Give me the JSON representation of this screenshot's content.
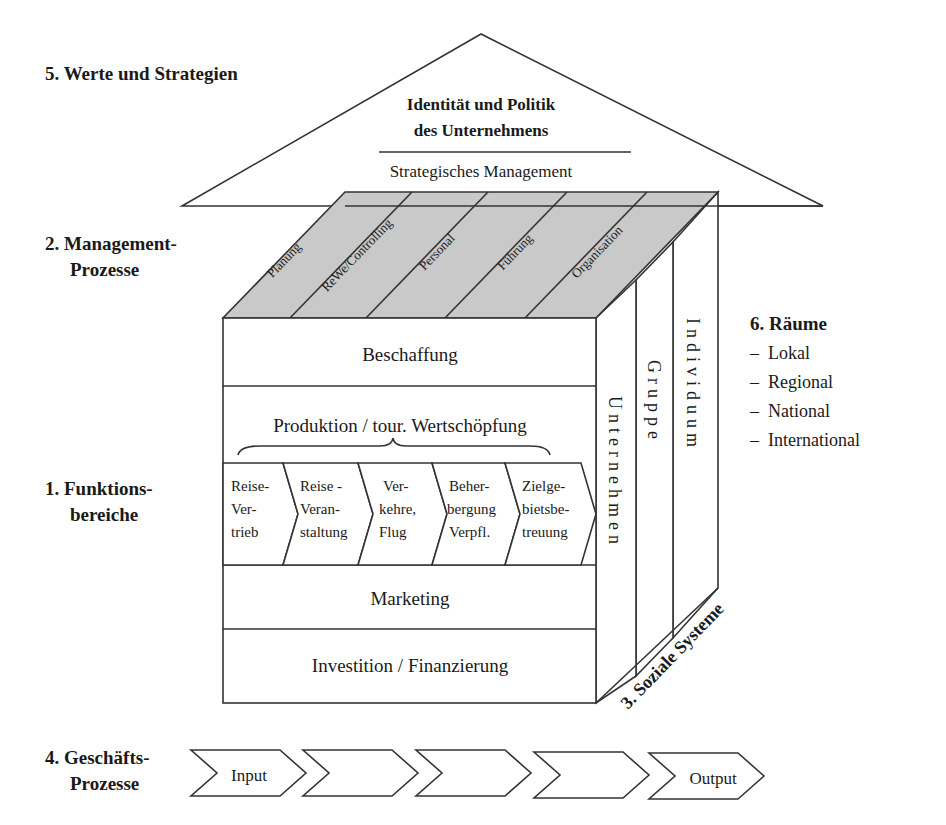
{
  "roof": {
    "section_label": "5. Werte und Strategien",
    "title_line1": "Identität und Politik",
    "title_line2": "des Unternehmens",
    "subtitle": "Strategisches Management"
  },
  "management": {
    "section_label_line1": "2. Management-",
    "section_label_line2": "Prozesse",
    "processes": [
      "Planung",
      "ReWe/Controlling",
      "Personal",
      "Führung",
      "Organisation"
    ]
  },
  "functions": {
    "section_label_line1": "1. Funktions-",
    "section_label_line2": "bereiche",
    "beschaffung": "Beschaffung",
    "produktion": "Produktion / tour. Wertschöpfung",
    "value_chain": [
      {
        "l1": "Reise-",
        "l2": "Ver-",
        "l3": "trieb"
      },
      {
        "l1": "Reise -",
        "l2": "Veran-",
        "l3": "staltung"
      },
      {
        "l1": "Ver-",
        "l2": "kehre,",
        "l3": "Flug"
      },
      {
        "l1": "Beher-",
        "l2": "bergung",
        "l3": "Verpfl."
      },
      {
        "l1": "Zielge-",
        "l2": "bietsbe-",
        "l3": "treuung"
      }
    ],
    "marketing": "Marketing",
    "investition": "Investition / Finanzierung"
  },
  "social_systems": {
    "section_label": "3. Soziale Systeme",
    "levels": [
      "Unternehmen",
      "Gruppe",
      "Individuum"
    ]
  },
  "business_processes": {
    "section_label_line1": "4. Geschäfts-",
    "section_label_line2": "Prozesse",
    "steps": [
      "Input",
      "",
      "",
      "",
      "Output"
    ]
  },
  "spaces": {
    "section_label": "6. Räume",
    "items": [
      "–  Lokal",
      "–  Regional",
      "–  National",
      "–  International"
    ]
  },
  "colors": {
    "shade": "#c9c9c9",
    "line": "#333333",
    "text": "#1a1a1a"
  }
}
